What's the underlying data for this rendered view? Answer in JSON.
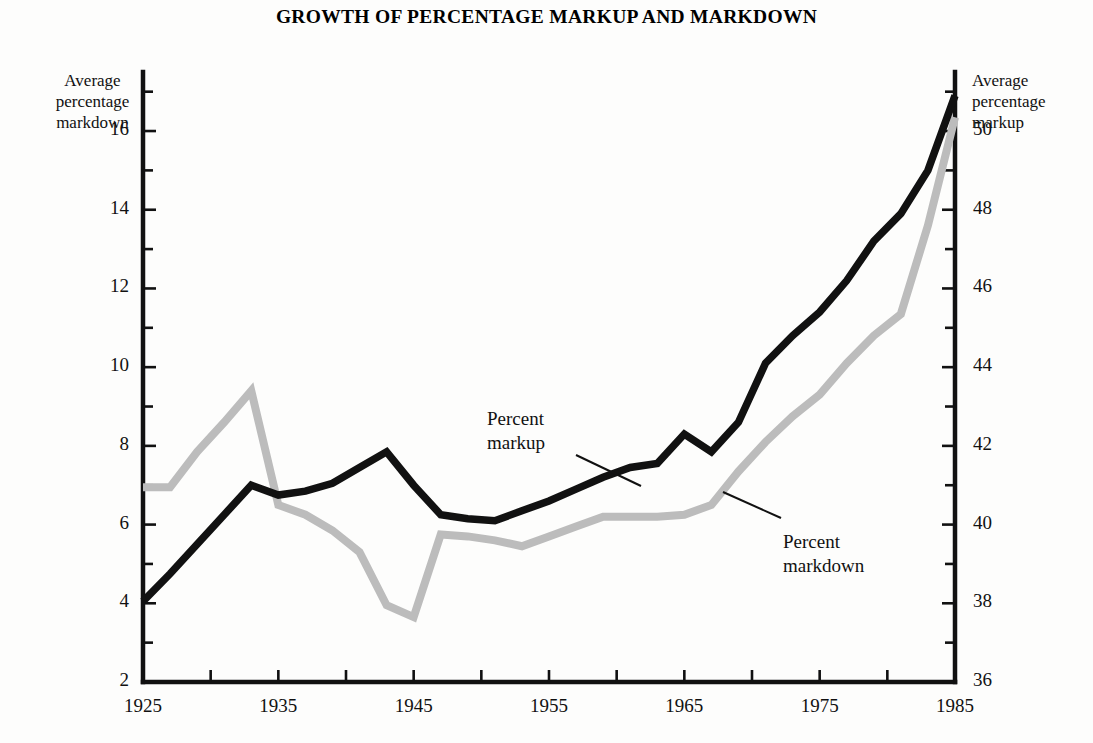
{
  "title": "GROWTH OF PERCENTAGE MARKUP AND MARKDOWN",
  "axes": {
    "left_caption_line1": "Average",
    "left_caption_line2": "percentage",
    "left_caption_line3": "markdown",
    "right_caption_line1": "Average",
    "right_caption_line2": "percentage",
    "right_caption_line3": "markup",
    "left_ticks": [
      "16",
      "14",
      "12",
      "10",
      "8",
      "6",
      "4",
      "2"
    ],
    "right_ticks": [
      "50",
      "48",
      "46",
      "44",
      "42",
      "40",
      "38",
      "36"
    ],
    "x_ticks": [
      "1925",
      "1935",
      "1945",
      "1955",
      "1965",
      "1975",
      "1985"
    ]
  },
  "annotations": {
    "markup_line1": "Percent",
    "markup_line2": "markup",
    "markdown_line1": "Percent",
    "markdown_line2": "markdown"
  },
  "colors": {
    "markup_line": "#111111",
    "markdown_line": "#bcbcbc",
    "axis": "#111111",
    "background": "#fdfdfc"
  },
  "chart_data": {
    "type": "line",
    "title": "GROWTH OF PERCENTAGE MARKUP AND MARKDOWN",
    "xlabel": "",
    "ylabel": "Average percentage markdown",
    "ylabel_right": "Average percentage markup",
    "xlim": [
      1925,
      1985
    ],
    "ylim_left": [
      2,
      17.5
    ],
    "ylim_right": [
      36,
      51.5
    ],
    "xticks": [
      1925,
      1935,
      1945,
      1955,
      1965,
      1975,
      1985
    ],
    "xticks_minor_step": 5,
    "yticks_left": [
      2,
      4,
      6,
      8,
      10,
      12,
      14,
      16
    ],
    "yticks_right": [
      36,
      38,
      40,
      42,
      44,
      46,
      48,
      50
    ],
    "yticks_minor_step": 1,
    "grid": false,
    "legend": "annotated-inline",
    "series": [
      {
        "name": "Percent markup",
        "axis": "right",
        "color": "#111111",
        "x": [
          1925,
          1927,
          1929,
          1931,
          1933,
          1935,
          1937,
          1939,
          1941,
          1943,
          1945,
          1947,
          1949,
          1951,
          1953,
          1955,
          1957,
          1959,
          1961,
          1963,
          1965,
          1967,
          1969,
          1971,
          1973,
          1975,
          1977,
          1979,
          1981,
          1983,
          1985
        ],
        "values_left_scale": [
          4.05,
          4.75,
          5.5,
          6.25,
          7.0,
          6.75,
          6.85,
          7.05,
          7.45,
          7.85,
          7.0,
          6.25,
          6.15,
          6.1,
          6.35,
          6.6,
          6.9,
          7.2,
          7.45,
          7.55,
          8.3,
          7.85,
          8.6,
          10.1,
          10.8,
          11.4,
          12.2,
          13.2,
          13.9,
          15.0,
          16.9
        ],
        "values": [
          38.05,
          38.75,
          39.5,
          40.25,
          41.0,
          40.75,
          40.85,
          41.05,
          41.45,
          41.85,
          41.0,
          40.25,
          40.15,
          40.1,
          40.35,
          40.6,
          40.9,
          41.2,
          41.45,
          41.55,
          42.3,
          41.85,
          42.6,
          44.1,
          44.8,
          45.4,
          46.2,
          47.2,
          47.9,
          49.0,
          50.9
        ]
      },
      {
        "name": "Percent markdown",
        "axis": "left",
        "color": "#bcbcbc",
        "x": [
          1925,
          1927,
          1929,
          1931,
          1933,
          1935,
          1937,
          1939,
          1941,
          1943,
          1945,
          1947,
          1949,
          1951,
          1953,
          1955,
          1957,
          1959,
          1961,
          1963,
          1965,
          1967,
          1969,
          1971,
          1973,
          1975,
          1977,
          1979,
          1981,
          1983,
          1985
        ],
        "values": [
          6.95,
          6.95,
          7.85,
          8.6,
          9.4,
          6.5,
          6.25,
          5.85,
          5.3,
          3.95,
          3.65,
          5.75,
          5.7,
          5.6,
          5.45,
          5.7,
          5.95,
          6.2,
          6.2,
          6.2,
          6.25,
          6.5,
          7.35,
          8.1,
          8.75,
          9.3,
          10.1,
          10.8,
          11.35,
          13.6,
          16.35
        ],
        "values_right_scale": [
          40.95,
          40.95,
          41.85,
          42.6,
          43.4,
          40.5,
          40.25,
          39.85,
          39.3,
          37.95,
          37.65,
          39.75,
          39.7,
          39.6,
          39.45,
          39.7,
          39.95,
          40.2,
          40.2,
          40.2,
          40.25,
          40.5,
          41.35,
          42.1,
          42.75,
          43.3,
          44.1,
          44.8,
          45.35,
          47.6,
          50.35
        ]
      }
    ]
  }
}
